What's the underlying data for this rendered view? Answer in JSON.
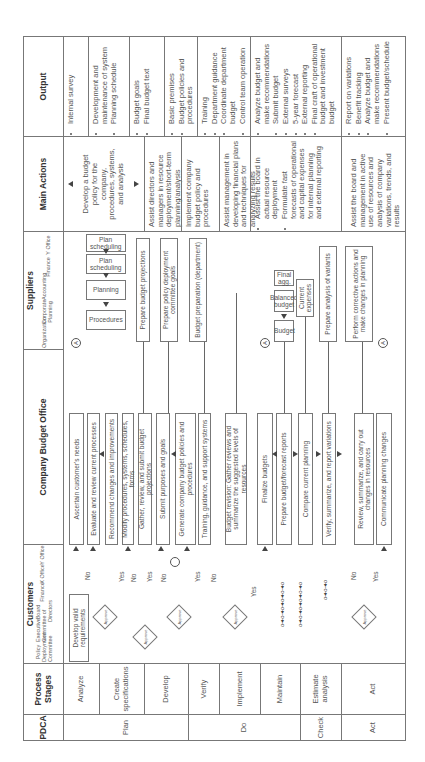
{
  "headers": {
    "pdca": "PDCA",
    "process_stages": "Process Stages",
    "customers": "Customers",
    "company_budget_office": "Company Budget Office",
    "suppliers": "Suppliers",
    "main_actions": "Main Actions",
    "output": "Output"
  },
  "customer_subcolumns": [
    "Policy Deployment Committee",
    "Executive Committee",
    "Board of Directors",
    "Finance",
    "X Office",
    "Y Office"
  ],
  "supplier_subcolumns": [
    "Organization",
    "Corporate Planning",
    "Accounting",
    "Finance",
    "Y Office"
  ],
  "pdca": [
    "Plan",
    "Do",
    "Check",
    "Act"
  ],
  "stages": [
    "Analyze",
    "Create specifications",
    "Develop",
    "Verify",
    "Implement",
    "Maintain",
    "Estimate analysis",
    "Act"
  ],
  "main_actions": [
    "Develop a budget policy for the company, procedures, systems, and analysis",
    "Assist directors and managers in resource deployment/short-term planning/analysis",
    "Implement company budget policy and procedures",
    "Assist management in developing financial plans and techniques for analyzing results",
    "Assist the board in actual resource deployment",
    "Formulate fast forecasts of operational and capital expenses for internal planning and external reporting",
    "Assist the board and management in active use of resources and analysis of company variations, trends, and results"
  ],
  "outputs": {
    "analyze": [
      "Internal survey"
    ],
    "create": [
      "Development and maintenance of system",
      "Planning schedule"
    ],
    "develop": [
      "Budget goals",
      "Final budget text"
    ],
    "verify": [
      "Basic premises",
      "Budget policies and procedures"
    ],
    "implement": [
      "Training",
      "Department guidance",
      "Coordinate department budget",
      "Control team operation"
    ],
    "maintain": [
      "Analyze budget and make recommendations",
      "Submit budget",
      "External surveys",
      "5-year forecast",
      "External reporting",
      "Final craft of operational budget and investment budget"
    ],
    "act": [
      "Report on variations",
      "Benefit tracking",
      "Analyze budget and make recommendations",
      "Present budget/schedule"
    ]
  },
  "cbo_boxes": [
    "Ascertain customer's needs",
    "Evaluate and review current processes",
    "Recommend changes and improvements",
    "Modify procedures, systems, schedules, forms",
    "Gather, review, and submit budget projections",
    "Submit purposes and goals",
    "Generate company budget policies and procedures",
    "Training, guidance, and support systems",
    "Budget revision: Gather reviews and summarize the suggested levels of resources",
    "Finalize budgets",
    "Prepare budget/forecast reports",
    "Compare current planning",
    "Verify, summarize, and report variations",
    "Review, summarize, and carry out changes in resources",
    "Communicate planning changes"
  ],
  "supplier_boxes": {
    "plan_scheduling_1": "Plan scheduling",
    "plan_scheduling_2": "Plan scheduling",
    "planning": "Planning",
    "procedures": "Procedures",
    "prepare_budget_projections": "Prepare budget projections",
    "prepare_policy_goals": "Prepare policy deployment committee goals",
    "budget_preparation": "Budget preparation (department)",
    "final_agg": "Final agg.",
    "balanced_budget": "Balanced budget",
    "budget": "Budget",
    "current_expenses": "Current expenses",
    "prepare_analysis": "Prepare analysis of variants",
    "perform_corrective": "Perform corrective actions and make changes in planning"
  },
  "customer_boxes": {
    "develop_valid_requirements": "Develop valid requirements",
    "approve": "Approve"
  },
  "labels": {
    "yes": "Yes",
    "no": "No",
    "connector": "A"
  }
}
